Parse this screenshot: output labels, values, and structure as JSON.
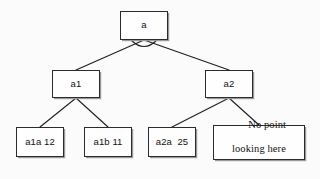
{
  "diagram": {
    "type": "tree-diagram",
    "background_color": "#fbfbfc",
    "box_fill_color": "#fefefe",
    "box_border_color": "#2b2b2b",
    "edge_color": "#1f1f1f",
    "nodes": [
      {
        "id": "root",
        "label": "a",
        "font": "sans",
        "x": 120,
        "y": 11,
        "w": 48,
        "h": 29
      },
      {
        "id": "a1",
        "label": "a1",
        "font": "sans",
        "x": 52,
        "y": 70,
        "w": 48,
        "h": 28
      },
      {
        "id": "a2",
        "label": "a2",
        "font": "sans",
        "x": 205,
        "y": 70,
        "w": 48,
        "h": 28
      },
      {
        "id": "a1a",
        "label": "a1a 12",
        "font": "sans",
        "x": 16,
        "y": 127,
        "w": 48,
        "h": 30
      },
      {
        "id": "a1b",
        "label": "a1b 11",
        "font": "sans",
        "x": 84,
        "y": 127,
        "w": 48,
        "h": 30
      },
      {
        "id": "a2a",
        "label": "a2a  25",
        "font": "sans",
        "x": 148,
        "y": 127,
        "w": 48,
        "h": 30
      },
      {
        "id": "no-point",
        "label_line1": "No point",
        "label_line2": "looking here",
        "font": "serif",
        "x": 213,
        "y": 125,
        "w": 92,
        "h": 35
      }
    ],
    "edges": [
      {
        "from": "root",
        "to": "a1"
      },
      {
        "from": "root",
        "to": "a2"
      },
      {
        "from": "a1",
        "to": "a1a"
      },
      {
        "from": "a1",
        "to": "a1b"
      },
      {
        "from": "a2",
        "to": "a2a"
      },
      {
        "from": "a2",
        "to": "no-point"
      }
    ],
    "root_arc": {
      "present": true,
      "description": "small arc spanning the two root edges just below the root box"
    }
  }
}
